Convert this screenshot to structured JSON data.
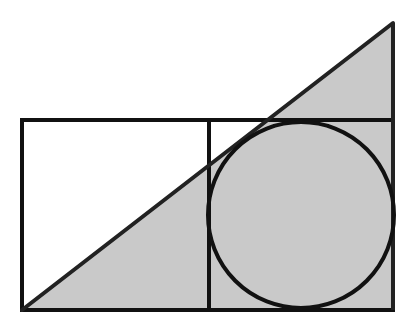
{
  "diagram": {
    "type": "geometry",
    "colors": {
      "background": "#ffffff",
      "stroke": "#111111",
      "fill_shaded": "#c9c9c9"
    },
    "stroke_width": 4,
    "triangle": {
      "vertices": [
        [
          22,
          310
        ],
        [
          393,
          310
        ],
        [
          393,
          23
        ]
      ],
      "label": "right triangle"
    },
    "rectangle": {
      "x": 22,
      "y": 120,
      "width": 371,
      "height": 190,
      "label": "outer rectangle"
    },
    "divider": {
      "x": 209,
      "y1": 120,
      "y2": 310,
      "label": "square divider"
    },
    "circle": {
      "cx": 301,
      "cy": 215,
      "r": 93,
      "label": "inscribed circle"
    }
  }
}
